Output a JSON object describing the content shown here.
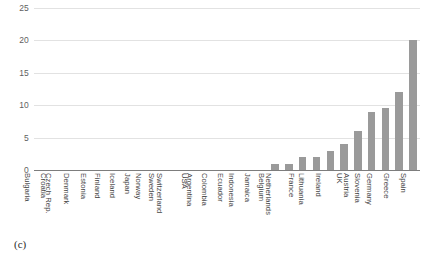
{
  "figure": {
    "caption": "(c)"
  },
  "chart_data": {
    "type": "bar",
    "title": "",
    "xlabel": "",
    "ylabel": "",
    "ylim": [
      0,
      25
    ],
    "yticks": [
      0,
      5,
      10,
      15,
      20,
      25
    ],
    "ytick_labels": [
      "0",
      "5",
      "10",
      "15",
      "20",
      "25"
    ],
    "grid": true,
    "legend": false,
    "bar_color": "#9a9a9a",
    "gridline_color": "#e2e2e2",
    "axis_color": "#7d7d7d",
    "categories": [
      "Bulgaria",
      "Croatia",
      "Czech Rep.",
      "Denmark",
      "Estonia",
      "Finland",
      "Iceland",
      "Japan",
      "Norway",
      "Sweden",
      "Switzerland",
      "USA",
      "Argentina",
      "Colombia",
      "Ecuador",
      "Indonesia",
      "Jamaica",
      "Belgium",
      "Netherlands",
      "France",
      "Lithuania",
      "Ireland",
      "UK",
      "Austria",
      "Slovenia",
      "Germany",
      "Greece",
      "Spain"
    ],
    "values": [
      0,
      0,
      0,
      0,
      0,
      0,
      0,
      0,
      0,
      0,
      0,
      0,
      0,
      0,
      0,
      0,
      0,
      1,
      1,
      2,
      2,
      3,
      4,
      6,
      9,
      9.5,
      12,
      20
    ]
  }
}
